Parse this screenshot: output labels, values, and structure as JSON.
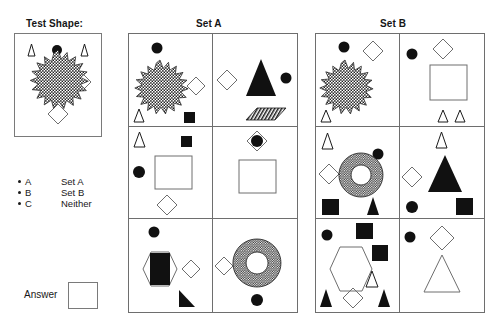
{
  "headings": {
    "test_shape": "Test Shape:",
    "set_a": "Set A",
    "set_b": "Set B"
  },
  "legend": {
    "rows": [
      {
        "bullet": "bullet-dot",
        "key": "A",
        "value": "Set A"
      },
      {
        "bullet": "bullet-dot",
        "key": "B",
        "value": "Set B"
      },
      {
        "bullet": "bullet-dot",
        "key": "C",
        "value": "Neither"
      }
    ]
  },
  "answer": {
    "label": "Answer",
    "value": ""
  },
  "test_shape": {
    "shapes": [
      {
        "type": "triangle-outline",
        "fill": "none"
      },
      {
        "type": "circle-filled",
        "fill": "#111111"
      },
      {
        "type": "triangle-outline",
        "fill": "none"
      },
      {
        "type": "starburst-textured",
        "fill": "texture"
      },
      {
        "type": "diamond-outline",
        "fill": "none"
      },
      {
        "type": "diamond-outline",
        "fill": "none"
      },
      {
        "type": "diamond-outline",
        "fill": "none"
      }
    ]
  },
  "set_a": {
    "title": "Set A",
    "cells": [
      {
        "id": "a1",
        "shapes": [
          "circle-filled",
          "starburst-textured",
          "diamond-outline",
          "triangle-outline",
          "square-filled"
        ]
      },
      {
        "id": "a2",
        "shapes": [
          "diamond-outline",
          "triangle-filled-large",
          "circle-filled",
          "parallelogram-textured"
        ]
      },
      {
        "id": "a3",
        "shapes": [
          "triangle-outline",
          "square-filled",
          "circle-filled",
          "square-outline-large",
          "diamond-outline"
        ]
      },
      {
        "id": "a4",
        "shapes": [
          "diamond-outline-with-circle",
          "square-outline-large"
        ]
      },
      {
        "id": "a5",
        "shapes": [
          "circle-filled",
          "hexagon-outline",
          "rectangle-filled",
          "diamond-outline",
          "right-triangle-filled"
        ]
      },
      {
        "id": "a6",
        "shapes": [
          "diamond-outline",
          "donut-textured",
          "circle-filled"
        ]
      }
    ]
  },
  "set_b": {
    "title": "Set B",
    "cells": [
      {
        "id": "b1",
        "shapes": [
          "circle-filled",
          "diamond-outline",
          "starburst-textured",
          "triangle-outline"
        ]
      },
      {
        "id": "b2",
        "shapes": [
          "circle-filled",
          "diamond-outline",
          "square-outline-large",
          "triangle-outline",
          "triangle-outline"
        ]
      },
      {
        "id": "b3",
        "shapes": [
          "triangle-outline",
          "circle-filled",
          "diamond-outline",
          "donut-textured",
          "square-filled",
          "triangle-filled"
        ]
      },
      {
        "id": "b4",
        "shapes": [
          "triangle-outline",
          "diamond-outline",
          "triangle-filled-large",
          "circle-filled",
          "square-filled"
        ]
      },
      {
        "id": "b5",
        "shapes": [
          "circle-filled",
          "square-filled",
          "square-filled",
          "hexagon-outline",
          "triangle-outline",
          "triangle-filled",
          "diamond-outline",
          "triangle-filled"
        ]
      },
      {
        "id": "b6",
        "shapes": [
          "circle-filled",
          "diamond-outline",
          "triangle-outline-large"
        ]
      }
    ]
  },
  "colors": {
    "ink": "#111111",
    "outline": "#6e6e6e",
    "border": "#7a7a7a",
    "background": "#ffffff"
  }
}
